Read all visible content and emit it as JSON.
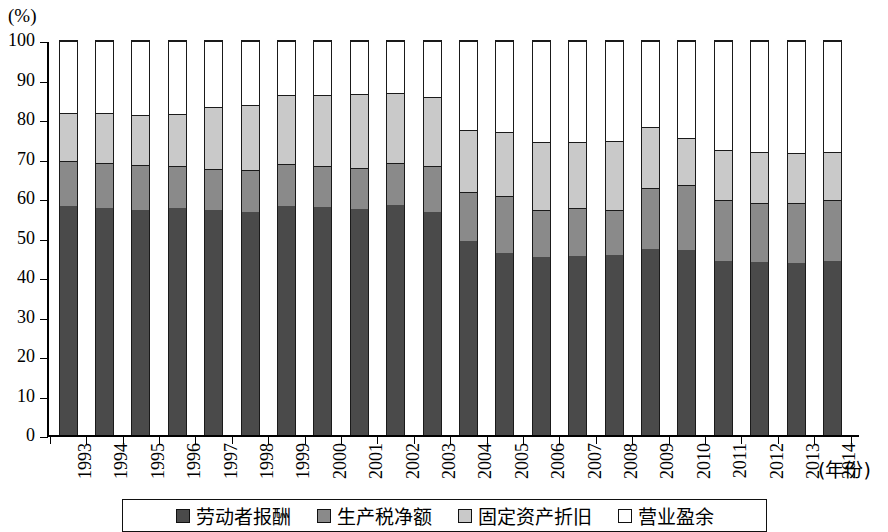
{
  "chart": {
    "unit_label": "(%)",
    "x_axis_caption": "(年份)"
  },
  "legend": {
    "items": [
      {
        "label": "劳动者报酬",
        "color": "#4a4a4a",
        "swatch": "legend-swatch-dark"
      },
      {
        "label": "生产税净额",
        "color": "#8a8a8a",
        "swatch": "legend-swatch-medium"
      },
      {
        "label": "固定资产折旧",
        "color": "#c9c9c9",
        "swatch": "legend-swatch-light"
      },
      {
        "label": "营业盈余",
        "color": "#ffffff",
        "swatch": "legend-swatch-white"
      }
    ]
  },
  "chart_data": {
    "type": "bar",
    "stacked": true,
    "normalized_to_100": true,
    "title": "",
    "subtitle": "",
    "xlabel": "(年份)",
    "ylabel": "(%)",
    "ylim": [
      0,
      100
    ],
    "yticks": [
      0,
      10,
      20,
      30,
      40,
      50,
      60,
      70,
      80,
      90,
      100
    ],
    "ytick_labels": [
      "0",
      "10",
      "20",
      "30",
      "40",
      "50",
      "60",
      "70",
      "80",
      "90",
      "100"
    ],
    "grid": false,
    "legend_position": "bottom",
    "categories": [
      "1993",
      "1994",
      "1995",
      "1996",
      "1997",
      "1998",
      "1999",
      "2000",
      "2001",
      "2002",
      "2003",
      "2004",
      "2005",
      "2006",
      "2007",
      "2008",
      "2009",
      "2010",
      "2011",
      "2012",
      "2013",
      "2014"
    ],
    "series": [
      {
        "name": "劳动者报酬",
        "color": "#4a4a4a",
        "values": [
          58.0,
          57.6,
          57.1,
          57.5,
          57.0,
          56.5,
          58.1,
          57.9,
          57.4,
          58.5,
          56.5,
          49.3,
          46.2,
          45.2,
          45.5,
          45.6,
          47.3,
          47.0,
          44.2,
          43.8,
          43.7,
          44.1
        ]
      },
      {
        "name": "生产税净额",
        "color": "#8a8a8a",
        "values": [
          11.5,
          11.4,
          11.5,
          10.9,
          10.4,
          10.7,
          10.6,
          10.4,
          10.4,
          10.5,
          11.8,
          12.4,
          14.4,
          11.9,
          12.1,
          11.5,
          15.5,
          16.4,
          15.4,
          15.2,
          15.2,
          15.6
        ]
      },
      {
        "name": "固定资产折旧",
        "color": "#c9c9c9",
        "values": [
          12.3,
          12.7,
          12.7,
          13.2,
          15.9,
          16.5,
          17.6,
          18.1,
          18.8,
          17.8,
          17.6,
          15.7,
          16.2,
          17.2,
          16.8,
          17.4,
          15.5,
          11.9,
          12.8,
          12.8,
          12.8,
          12.2
        ]
      },
      {
        "name": "营业盈余",
        "color": "#ffffff",
        "values": [
          18.2,
          18.3,
          18.7,
          18.4,
          16.7,
          16.3,
          13.7,
          13.6,
          13.4,
          13.2,
          14.1,
          22.6,
          23.2,
          25.7,
          25.6,
          25.5,
          21.7,
          24.7,
          27.6,
          28.2,
          28.3,
          28.1
        ]
      }
    ],
    "cumulative_tops": {
      "note": "upper boundary (%) of each stacked segment per year",
      "after_series_0": [
        58.0,
        57.6,
        57.1,
        57.5,
        57.0,
        56.5,
        58.1,
        57.9,
        57.4,
        58.5,
        56.5,
        49.3,
        46.2,
        45.2,
        45.5,
        45.6,
        47.3,
        47.0,
        44.2,
        43.8,
        43.7,
        44.1
      ],
      "after_series_1": [
        69.5,
        69.0,
        68.6,
        68.4,
        67.4,
        67.2,
        68.7,
        68.3,
        67.8,
        69.0,
        68.3,
        61.7,
        60.6,
        57.1,
        57.6,
        57.1,
        62.8,
        63.4,
        59.6,
        59.0,
        58.9,
        59.7
      ],
      "after_series_2": [
        81.8,
        81.7,
        81.3,
        81.6,
        83.3,
        83.7,
        86.3,
        86.4,
        86.6,
        86.8,
        85.9,
        77.4,
        76.8,
        74.3,
        74.4,
        74.5,
        78.3,
        75.3,
        72.4,
        71.8,
        71.7,
        71.9
      ],
      "after_series_3": [
        100,
        100,
        100,
        100,
        100,
        100,
        100,
        100,
        100,
        100,
        100,
        100,
        100,
        100,
        100,
        100,
        100,
        100,
        100,
        100,
        100,
        100
      ]
    }
  }
}
